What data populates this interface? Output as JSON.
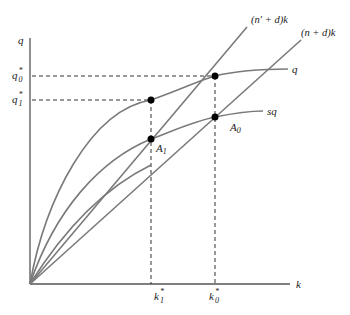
{
  "diagram": {
    "type": "solow-growth-model",
    "axes": {
      "x_label": "k",
      "y_label": "q"
    },
    "curves": [
      {
        "name": "output",
        "label": "q"
      },
      {
        "name": "savings",
        "label": "sq"
      }
    ],
    "lines": [
      {
        "name": "new-depreciation-line",
        "label": "(n′ + d)k"
      },
      {
        "name": "depreciation-line",
        "label": "(n + d)k"
      }
    ],
    "points": [
      {
        "name": "A0",
        "label": "A",
        "sub": "0"
      },
      {
        "name": "A1",
        "label": "A",
        "sub": "1"
      }
    ],
    "y_markers": [
      {
        "name": "q0-star",
        "label": "q",
        "sup": "*",
        "sub": "0"
      },
      {
        "name": "q1-star",
        "label": "q",
        "sup": "*",
        "sub": "1"
      }
    ],
    "x_markers": [
      {
        "name": "k1-star",
        "label": "k",
        "sup": "*",
        "sub": "1"
      },
      {
        "name": "k0-star",
        "label": "k",
        "sup": "*",
        "sub": "0"
      }
    ]
  },
  "colors": {
    "curve": "#777777",
    "axis": "#555555",
    "dot": "#000000",
    "text": "#222222"
  }
}
